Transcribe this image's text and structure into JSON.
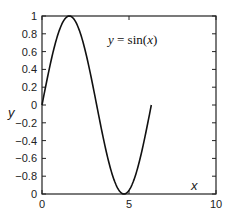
{
  "chart_data": {
    "type": "line",
    "title": "",
    "annotation": {
      "y": "y",
      "eq": " = sin(",
      "x": "x",
      "close": ")"
    },
    "xlabel": "x",
    "ylabel": "y",
    "xlim": [
      0,
      10
    ],
    "ylim": [
      -1,
      1
    ],
    "x_ticks": [
      0,
      5,
      10
    ],
    "x_tick_labels": [
      "0",
      "5",
      "10"
    ],
    "y_ticks": [
      1,
      0.8,
      0.6,
      0.4,
      0.2,
      0,
      -0.2,
      -0.4,
      -0.6,
      -0.8,
      -1
    ],
    "y_tick_labels": [
      "1",
      "0.8",
      "0.6",
      "0.4",
      "0.2",
      "0",
      "−0.2",
      "−0.4",
      "−0.6",
      "−0.8",
      "0"
    ],
    "grid": false,
    "legend": null,
    "series": [
      {
        "name": "sin(x)",
        "function": "sin",
        "x_start": 0,
        "x_end": 6.2832,
        "x": [
          0,
          0.5236,
          1.0472,
          1.5708,
          2.0944,
          2.618,
          3.1416,
          3.6652,
          4.1888,
          4.7124,
          5.236,
          5.7596,
          6.2832
        ],
        "y": [
          0,
          0.5,
          0.866,
          1,
          0.866,
          0.5,
          0,
          -0.5,
          -0.866,
          -1,
          -0.866,
          -0.5,
          0
        ],
        "color": "#111111"
      }
    ]
  }
}
